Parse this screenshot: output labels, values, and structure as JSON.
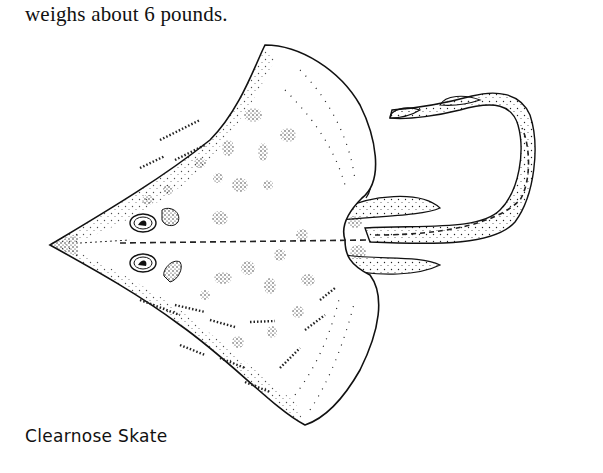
{
  "page": {
    "body_text": "weighs about 6 pounds.",
    "figure": {
      "subject": "skate-illustration",
      "style": "stippled-line-drawing",
      "caption": "Clearnose Skate"
    }
  },
  "colors": {
    "ink": "#111111",
    "paper": "#ffffff"
  }
}
